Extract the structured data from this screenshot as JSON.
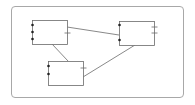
{
  "diagram": {
    "frame": {
      "x": 11,
      "y": 6,
      "w": 173,
      "h": 92,
      "stroke": "#a8a8a8"
    },
    "colors": {
      "box_stroke": "#6a6a6a",
      "line": "#6a6a6a",
      "port": "#222222",
      "tick": "#6a6a6a"
    },
    "nodes": [
      {
        "id": "node-1",
        "x": 32,
        "y": 20,
        "w": 35,
        "h": 24,
        "ports_left": [
          25,
          32,
          39
        ],
        "ticks_right": [
          33
        ]
      },
      {
        "id": "node-2",
        "x": 119,
        "y": 21,
        "w": 35,
        "h": 24,
        "ports_left": [
          25,
          40
        ],
        "ticks_right": [
          27,
          33
        ]
      },
      {
        "id": "node-3",
        "x": 48,
        "y": 61,
        "w": 35,
        "h": 24,
        "ports_left": [
          66,
          74
        ],
        "ticks_right": [
          68
        ]
      }
    ],
    "edges": [
      {
        "id": "edge-1-2",
        "x1": 67,
        "y1": 27,
        "x2": 119,
        "y2": 35
      },
      {
        "id": "edge-1-3",
        "x1": 52,
        "y1": 44,
        "x2": 68,
        "y2": 61
      },
      {
        "id": "edge-2-3",
        "x1": 135,
        "y1": 45,
        "x2": 83,
        "y2": 77
      }
    ]
  }
}
